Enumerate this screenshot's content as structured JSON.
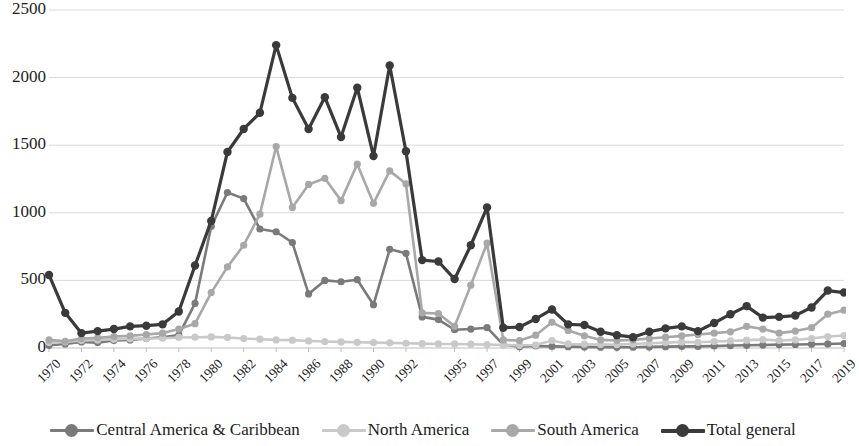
{
  "chart_data": {
    "type": "line",
    "title": "",
    "subtitle": "",
    "xlabel": "",
    "ylabel": "",
    "ylim": [
      0,
      2500
    ],
    "ytick_values": [
      0,
      500,
      1000,
      1500,
      2000,
      2500
    ],
    "ytick_labels": [
      "0",
      "500",
      "1000",
      "1500",
      "2000",
      "2500"
    ],
    "grid": "horizontal",
    "legend_position": "bottom",
    "x": [
      "1970",
      "1971",
      "1972",
      "1973",
      "1974",
      "1975",
      "1976",
      "1977",
      "1978",
      "1979",
      "1980",
      "1981",
      "1982",
      "1983",
      "1984",
      "1985",
      "1986",
      "1987",
      "1988",
      "1989",
      "1990",
      "1991",
      "1992",
      "1993",
      "1994",
      "1995",
      "1996",
      "1997",
      "1998",
      "1999",
      "2000",
      "2001",
      "2002",
      "2003",
      "2004",
      "2005",
      "2006",
      "2007",
      "2008",
      "2009",
      "2010",
      "2011",
      "2012",
      "2013",
      "2014",
      "2015",
      "2016",
      "2017",
      "2018",
      "2019"
    ],
    "xtick_labels": [
      "1970",
      "1972",
      "1974",
      "1976",
      "1978",
      "1980",
      "1982",
      "1984",
      "1986",
      "1988",
      "1990",
      "1992",
      "1995",
      "1997",
      "1999",
      "2001",
      "2003",
      "2005",
      "2007",
      "2009",
      "2011",
      "2013",
      "2015",
      "2017",
      "2019"
    ],
    "series": [
      {
        "name": "Central America & Caribbean",
        "color": "#7a7a7a",
        "values": [
          20,
          30,
          45,
          40,
          55,
          60,
          70,
          80,
          95,
          330,
          900,
          1150,
          1105,
          880,
          860,
          780,
          400,
          500,
          490,
          505,
          320,
          730,
          700,
          230,
          210,
          135,
          140,
          150,
          25,
          10,
          15,
          12,
          10,
          8,
          6,
          5,
          6,
          8,
          10,
          12,
          12,
          15,
          18,
          20,
          22,
          25,
          26,
          28,
          30,
          33
        ]
      },
      {
        "name": "North America",
        "color": "#c9c9c9",
        "values": [
          40,
          45,
          55,
          60,
          65,
          68,
          70,
          72,
          78,
          80,
          82,
          78,
          70,
          65,
          60,
          58,
          52,
          48,
          45,
          42,
          40,
          38,
          35,
          32,
          30,
          30,
          28,
          25,
          22,
          20,
          22,
          55,
          30,
          28,
          26,
          25,
          30,
          35,
          40,
          45,
          42,
          48,
          52,
          58,
          62,
          55,
          60,
          70,
          85,
          92
        ]
      },
      {
        "name": "South America",
        "color": "#a8a8a8",
        "values": [
          60,
          50,
          70,
          75,
          85,
          90,
          100,
          110,
          140,
          180,
          410,
          600,
          760,
          990,
          1490,
          1040,
          1210,
          1255,
          1090,
          1360,
          1070,
          1310,
          1215,
          260,
          255,
          160,
          465,
          775,
          60,
          55,
          95,
          190,
          130,
          90,
          60,
          55,
          60,
          70,
          80,
          90,
          100,
          110,
          120,
          160,
          140,
          110,
          125,
          150,
          250,
          280
        ]
      },
      {
        "name": "Total general",
        "color": "#3a3a3a",
        "values": [
          540,
          260,
          110,
          125,
          140,
          160,
          165,
          175,
          270,
          610,
          940,
          1450,
          1620,
          1740,
          2240,
          1850,
          1620,
          1855,
          1560,
          1925,
          1420,
          2090,
          1455,
          650,
          640,
          510,
          760,
          1040,
          150,
          155,
          215,
          285,
          175,
          170,
          120,
          95,
          80,
          120,
          145,
          160,
          125,
          185,
          250,
          310,
          225,
          230,
          240,
          300,
          425,
          410
        ]
      }
    ]
  }
}
